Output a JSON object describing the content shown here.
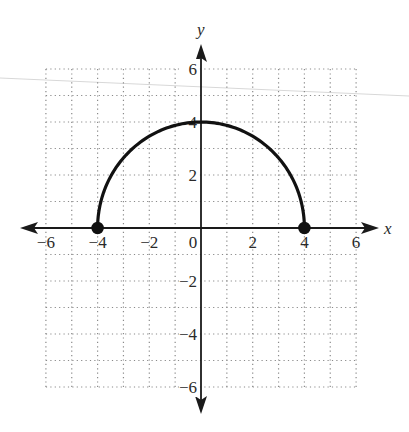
{
  "chart_data": {
    "type": "line",
    "title": "",
    "xlabel": "x",
    "ylabel": "y",
    "xlim": [
      -6,
      6
    ],
    "ylim": [
      -6,
      6
    ],
    "grid": true,
    "grid_step": 1,
    "x_ticks": [
      -6,
      -4,
      -2,
      0,
      2,
      4,
      6
    ],
    "y_ticks": [
      -6,
      -4,
      -2,
      2,
      4,
      6
    ],
    "x_tick_labels": [
      "−6",
      "−4",
      "−2",
      "0",
      "2",
      "4",
      "6"
    ],
    "y_tick_labels": [
      "−6",
      "−4",
      "−2",
      "2",
      "4",
      "6"
    ],
    "legend": null,
    "series": [
      {
        "name": "upper semicircle y = √(16 − x²)",
        "description": "Upper half of circle of radius 4 centered at origin",
        "x": [
          -4,
          -3,
          -2,
          -1,
          0,
          1,
          2,
          3,
          4
        ],
        "y": [
          0,
          2.65,
          3.46,
          3.87,
          4,
          3.87,
          3.46,
          2.65,
          0
        ],
        "endpoints": [
          {
            "x": -4,
            "y": 0,
            "style": "closed"
          },
          {
            "x": 4,
            "y": 0,
            "style": "closed"
          }
        ]
      }
    ]
  },
  "labels": {
    "x_axis": "x",
    "y_axis": "y"
  }
}
